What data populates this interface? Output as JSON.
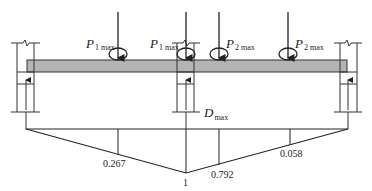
{
  "diagram": {
    "title": "",
    "beam_color": "#b4b4b4",
    "line_color": "#222222",
    "loads": [
      {
        "symbol": "P",
        "subscript": "1 max",
        "x": 118
      },
      {
        "symbol": "P",
        "subscript": "1 max",
        "x": 186
      },
      {
        "symbol": "P",
        "subscript": "2 max",
        "x": 219
      },
      {
        "symbol": "P",
        "subscript": "2 max",
        "x": 288
      }
    ],
    "reaction_label": {
      "symbol": "D",
      "subscript": "max"
    },
    "influence_line": {
      "apex_value": "1",
      "ordinates": [
        {
          "value": "0.267",
          "x": 118
        },
        {
          "value": "0.792",
          "x": 219
        },
        {
          "value": "0.058",
          "x": 290
        }
      ]
    }
  }
}
